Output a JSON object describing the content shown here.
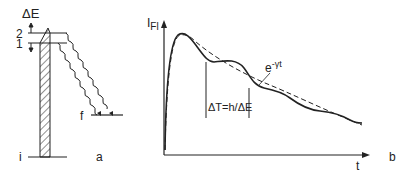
{
  "panel_a": {
    "label": "a",
    "delta_e_label": "ΔE",
    "level_2_label": "2",
    "level_1_label": "1",
    "final_level_label": "f",
    "initial_level_label": "i"
  },
  "panel_b": {
    "label": "b",
    "y_axis_label_main": "I",
    "y_axis_label_sub": "Fl",
    "x_axis_label": "t",
    "decay_label_base": "e",
    "decay_label_exp": "-γt",
    "beat_period_label": "ΔT=h/ΔE"
  },
  "colors": {
    "ink": "#222222",
    "background": "#ffffff"
  }
}
